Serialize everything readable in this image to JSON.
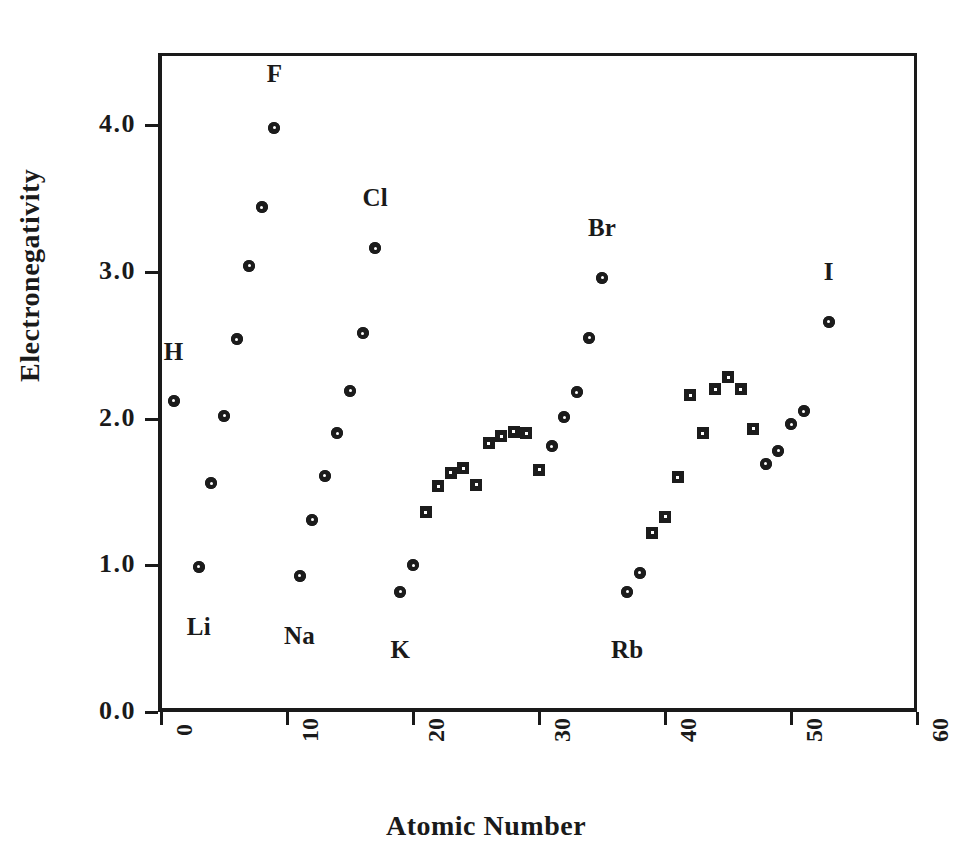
{
  "chart_data": {
    "type": "scatter",
    "title": "",
    "xlabel": "Atomic Number",
    "ylabel": "Electronegativity",
    "xlim": [
      0,
      60
    ],
    "ylim": [
      0.0,
      4.5
    ],
    "xticks": [
      "0",
      "10",
      "20",
      "30",
      "40",
      "50",
      "60"
    ],
    "xtick_values": [
      0,
      10,
      20,
      30,
      40,
      50,
      60
    ],
    "yticks": [
      "0.0",
      "1.0",
      "2.0",
      "3.0",
      "4.0"
    ],
    "ytick_values": [
      0.0,
      1.0,
      2.0,
      3.0,
      4.0
    ],
    "grid": false,
    "legend": "none",
    "marker_color": "#1c1c1c",
    "series": [
      {
        "name": "main-group-elements",
        "marker": "circle-dot",
        "points": [
          {
            "x": 1,
            "y": 2.12,
            "label": "H"
          },
          {
            "x": 3,
            "y": 0.99,
            "label": "Li"
          },
          {
            "x": 4,
            "y": 1.56,
            "label": ""
          },
          {
            "x": 5,
            "y": 2.02,
            "label": ""
          },
          {
            "x": 6,
            "y": 2.54,
            "label": ""
          },
          {
            "x": 7,
            "y": 3.04,
            "label": ""
          },
          {
            "x": 8,
            "y": 3.44,
            "label": ""
          },
          {
            "x": 9,
            "y": 3.98,
            "label": "F"
          },
          {
            "x": 11,
            "y": 0.93,
            "label": "Na"
          },
          {
            "x": 12,
            "y": 1.31,
            "label": ""
          },
          {
            "x": 13,
            "y": 1.61,
            "label": ""
          },
          {
            "x": 14,
            "y": 1.9,
            "label": ""
          },
          {
            "x": 15,
            "y": 2.19,
            "label": ""
          },
          {
            "x": 16,
            "y": 2.58,
            "label": ""
          },
          {
            "x": 17,
            "y": 3.16,
            "label": "Cl"
          },
          {
            "x": 19,
            "y": 0.82,
            "label": "K"
          },
          {
            "x": 20,
            "y": 1.0,
            "label": ""
          },
          {
            "x": 31,
            "y": 1.81,
            "label": ""
          },
          {
            "x": 32,
            "y": 2.01,
            "label": ""
          },
          {
            "x": 33,
            "y": 2.18,
            "label": ""
          },
          {
            "x": 34,
            "y": 2.55,
            "label": ""
          },
          {
            "x": 35,
            "y": 2.96,
            "label": "Br"
          },
          {
            "x": 37,
            "y": 0.82,
            "label": "Rb"
          },
          {
            "x": 38,
            "y": 0.95,
            "label": ""
          },
          {
            "x": 49,
            "y": 1.78,
            "label": ""
          },
          {
            "x": 48,
            "y": 1.69,
            "label": ""
          },
          {
            "x": 50,
            "y": 1.96,
            "label": ""
          },
          {
            "x": 51,
            "y": 2.05,
            "label": ""
          },
          {
            "x": 53,
            "y": 2.66,
            "label": "I"
          }
        ]
      },
      {
        "name": "transition-metals",
        "marker": "square",
        "points": [
          {
            "x": 21,
            "y": 1.36
          },
          {
            "x": 22,
            "y": 1.54
          },
          {
            "x": 23,
            "y": 1.63
          },
          {
            "x": 24,
            "y": 1.66
          },
          {
            "x": 25,
            "y": 1.55
          },
          {
            "x": 26,
            "y": 1.83
          },
          {
            "x": 27,
            "y": 1.88
          },
          {
            "x": 28,
            "y": 1.91
          },
          {
            "x": 29,
            "y": 1.9
          },
          {
            "x": 30,
            "y": 1.65
          },
          {
            "x": 39,
            "y": 1.22
          },
          {
            "x": 40,
            "y": 1.33
          },
          {
            "x": 41,
            "y": 1.6
          },
          {
            "x": 42,
            "y": 2.16
          },
          {
            "x": 43,
            "y": 1.9
          },
          {
            "x": 44,
            "y": 2.2
          },
          {
            "x": 45,
            "y": 2.28
          },
          {
            "x": 46,
            "y": 2.2
          },
          {
            "x": 47,
            "y": 1.93
          }
        ]
      }
    ],
    "annotations": [
      {
        "text": "H",
        "x": 1,
        "y": 2.45
      },
      {
        "text": "Li",
        "x": 3,
        "y": 0.58
      },
      {
        "text": "F",
        "x": 9,
        "y": 4.35
      },
      {
        "text": "Na",
        "x": 11,
        "y": 0.52
      },
      {
        "text": "Cl",
        "x": 17,
        "y": 3.5
      },
      {
        "text": "K",
        "x": 19,
        "y": 0.42
      },
      {
        "text": "Br",
        "x": 35,
        "y": 3.3
      },
      {
        "text": "Rb",
        "x": 37,
        "y": 0.42
      },
      {
        "text": "I",
        "x": 53,
        "y": 3.0
      }
    ]
  }
}
